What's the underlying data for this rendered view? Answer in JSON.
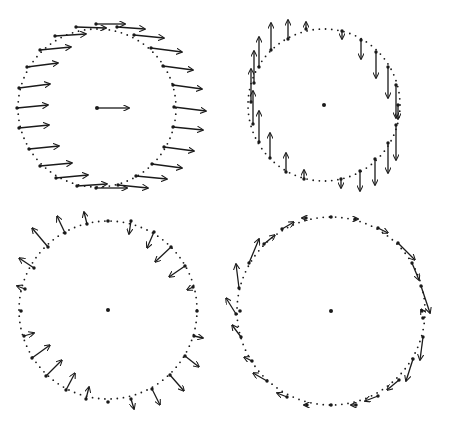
{
  "figure": {
    "width": 453,
    "height": 425,
    "ink_color": "#1a1a1a",
    "background": "#ffffff",
    "panels": [
      {
        "id": "top-left",
        "pattern": "uniform-translation-right",
        "cx": 97,
        "cy": 108,
        "r": 79,
        "center_arrow": {
          "dx": 32,
          "dy": 0
        },
        "arrows": [
          {
            "x": 96,
            "y": 24,
            "dx": 29,
            "dy": 0
          },
          {
            "x": 76,
            "y": 27,
            "dx": 30,
            "dy": 1
          },
          {
            "x": 117,
            "y": 27,
            "dx": 28,
            "dy": 2
          },
          {
            "x": 55,
            "y": 36,
            "dx": 31,
            "dy": -2
          },
          {
            "x": 134,
            "y": 35,
            "dx": 30,
            "dy": 3
          },
          {
            "x": 40,
            "y": 50,
            "dx": 31,
            "dy": -3
          },
          {
            "x": 151,
            "y": 48,
            "dx": 31,
            "dy": 4
          },
          {
            "x": 27,
            "y": 67,
            "dx": 31,
            "dy": -4
          },
          {
            "x": 163,
            "y": 66,
            "dx": 30,
            "dy": 4
          },
          {
            "x": 19,
            "y": 88,
            "dx": 31,
            "dy": -4
          },
          {
            "x": 173,
            "y": 85,
            "dx": 29,
            "dy": 4
          },
          {
            "x": 17,
            "y": 108,
            "dx": 31,
            "dy": -3
          },
          {
            "x": 174,
            "y": 107,
            "dx": 32,
            "dy": 4
          },
          {
            "x": 19,
            "y": 128,
            "dx": 30,
            "dy": -3
          },
          {
            "x": 173,
            "y": 127,
            "dx": 30,
            "dy": 3
          },
          {
            "x": 29,
            "y": 149,
            "dx": 30,
            "dy": -3
          },
          {
            "x": 164,
            "y": 147,
            "dx": 30,
            "dy": 4
          },
          {
            "x": 40,
            "y": 166,
            "dx": 32,
            "dy": -3
          },
          {
            "x": 152,
            "y": 164,
            "dx": 30,
            "dy": 4
          },
          {
            "x": 56,
            "y": 178,
            "dx": 32,
            "dy": -3
          },
          {
            "x": 136,
            "y": 176,
            "dx": 31,
            "dy": 3
          },
          {
            "x": 77,
            "y": 186,
            "dx": 30,
            "dy": -2
          },
          {
            "x": 118,
            "y": 185,
            "dx": 30,
            "dy": 3
          },
          {
            "x": 96,
            "y": 188,
            "dx": 31,
            "dy": 0
          }
        ]
      },
      {
        "id": "top-right",
        "pattern": "vertical-shear-rotation",
        "cx": 324,
        "cy": 105,
        "r": 76,
        "arrows": [
          {
            "x": 306,
            "y": 29,
            "dx": 0,
            "dy": -7
          },
          {
            "x": 288,
            "y": 39,
            "dx": 0,
            "dy": -19
          },
          {
            "x": 271,
            "y": 50,
            "dx": 0,
            "dy": -27
          },
          {
            "x": 259,
            "y": 67,
            "dx": 0,
            "dy": -30
          },
          {
            "x": 254,
            "y": 83,
            "dx": 0,
            "dy": -32
          },
          {
            "x": 251,
            "y": 102,
            "dx": 0,
            "dy": -33
          },
          {
            "x": 253,
            "y": 124,
            "dx": 0,
            "dy": -33
          },
          {
            "x": 259,
            "y": 142,
            "dx": 0,
            "dy": -31
          },
          {
            "x": 270,
            "y": 158,
            "dx": 0,
            "dy": -25
          },
          {
            "x": 286,
            "y": 172,
            "dx": 0,
            "dy": -19
          },
          {
            "x": 304,
            "y": 179,
            "dx": 0,
            "dy": -9
          },
          {
            "x": 342,
            "y": 31,
            "dx": 0,
            "dy": 8
          },
          {
            "x": 361,
            "y": 40,
            "dx": 0,
            "dy": 19
          },
          {
            "x": 376,
            "y": 52,
            "dx": 0,
            "dy": 26
          },
          {
            "x": 388,
            "y": 67,
            "dx": 0,
            "dy": 31
          },
          {
            "x": 396,
            "y": 85,
            "dx": 0,
            "dy": 33
          },
          {
            "x": 398,
            "y": 105,
            "dx": 0,
            "dy": 14
          },
          {
            "x": 396,
            "y": 125,
            "dx": 0,
            "dy": 35
          },
          {
            "x": 388,
            "y": 143,
            "dx": 0,
            "dy": 30
          },
          {
            "x": 375,
            "y": 159,
            "dx": 0,
            "dy": 26
          },
          {
            "x": 360,
            "y": 171,
            "dx": 0,
            "dy": 20
          },
          {
            "x": 341,
            "y": 179,
            "dx": 0,
            "dy": 9
          }
        ]
      },
      {
        "id": "bottom-left",
        "pattern": "pure-shear",
        "cx": 108,
        "cy": 310,
        "r": 89,
        "arrows": [
          {
            "x": 87,
            "y": 224,
            "dx": -3,
            "dy": -12
          },
          {
            "x": 65,
            "y": 233,
            "dx": -8,
            "dy": -17
          },
          {
            "x": 48,
            "y": 247,
            "dx": -16,
            "dy": -19
          },
          {
            "x": 34,
            "y": 268,
            "dx": -15,
            "dy": -10
          },
          {
            "x": 25,
            "y": 289,
            "dx": -8,
            "dy": -3
          },
          {
            "x": 24,
            "y": 336,
            "dx": 10,
            "dy": -3
          },
          {
            "x": 32,
            "y": 358,
            "dx": 18,
            "dy": -13
          },
          {
            "x": 46,
            "y": 376,
            "dx": 16,
            "dy": -16
          },
          {
            "x": 66,
            "y": 390,
            "dx": 9,
            "dy": -17
          },
          {
            "x": 86,
            "y": 399,
            "dx": 3,
            "dy": -12
          },
          {
            "x": 131,
            "y": 221,
            "dx": -2,
            "dy": 13
          },
          {
            "x": 154,
            "y": 232,
            "dx": -7,
            "dy": 16
          },
          {
            "x": 171,
            "y": 247,
            "dx": -16,
            "dy": 15
          },
          {
            "x": 185,
            "y": 266,
            "dx": -16,
            "dy": 11
          },
          {
            "x": 193,
            "y": 287,
            "dx": -6,
            "dy": 3
          },
          {
            "x": 194,
            "y": 336,
            "dx": 9,
            "dy": 2
          },
          {
            "x": 185,
            "y": 356,
            "dx": 14,
            "dy": 11
          },
          {
            "x": 170,
            "y": 375,
            "dx": 14,
            "dy": 16
          },
          {
            "x": 152,
            "y": 389,
            "dx": 8,
            "dy": 16
          },
          {
            "x": 131,
            "y": 399,
            "dx": 3,
            "dy": 10
          }
        ],
        "plain_points": [
          {
            "x": 108,
            "y": 221
          },
          {
            "x": 197,
            "y": 311
          },
          {
            "x": 108,
            "y": 402
          },
          {
            "x": 21,
            "y": 311
          }
        ]
      },
      {
        "id": "bottom-right",
        "pattern": "rotation-tangential",
        "cx": 331,
        "cy": 311,
        "r": 94,
        "arrows": [
          {
            "x": 306,
            "y": 218,
            "dx": -4,
            "dy": 0
          },
          {
            "x": 282,
            "y": 229,
            "dx": 12,
            "dy": -7
          },
          {
            "x": 264,
            "y": 244,
            "dx": 11,
            "dy": -9
          },
          {
            "x": 249,
            "y": 263,
            "dx": 10,
            "dy": -24
          },
          {
            "x": 239,
            "y": 288,
            "dx": -3,
            "dy": -24
          },
          {
            "x": 236,
            "y": 314,
            "dx": -10,
            "dy": -16
          },
          {
            "x": 241,
            "y": 337,
            "dx": -9,
            "dy": -12
          },
          {
            "x": 252,
            "y": 361,
            "dx": -8,
            "dy": -4
          },
          {
            "x": 267,
            "y": 381,
            "dx": -14,
            "dy": -8
          },
          {
            "x": 287,
            "y": 397,
            "dx": -10,
            "dy": -4
          },
          {
            "x": 307,
            "y": 405,
            "dx": -3,
            "dy": 0
          },
          {
            "x": 355,
            "y": 219,
            "dx": 3,
            "dy": 0
          },
          {
            "x": 378,
            "y": 228,
            "dx": 10,
            "dy": 5
          },
          {
            "x": 398,
            "y": 243,
            "dx": 17,
            "dy": 17
          },
          {
            "x": 412,
            "y": 263,
            "dx": 7,
            "dy": 17
          },
          {
            "x": 421,
            "y": 286,
            "dx": 9,
            "dy": 27
          },
          {
            "x": 422,
            "y": 311,
            "dx": -1,
            "dy": -2
          },
          {
            "x": 423,
            "y": 337,
            "dx": -3,
            "dy": 23
          },
          {
            "x": 413,
            "y": 359,
            "dx": -7,
            "dy": 22
          },
          {
            "x": 399,
            "y": 380,
            "dx": -12,
            "dy": 10
          },
          {
            "x": 378,
            "y": 396,
            "dx": -13,
            "dy": 5
          },
          {
            "x": 356,
            "y": 405,
            "dx": -5,
            "dy": 0
          }
        ],
        "plain_points": [
          {
            "x": 331,
            "y": 217
          },
          {
            "x": 331,
            "y": 405
          },
          {
            "x": 240,
            "y": 311
          },
          {
            "x": 423,
            "y": 318
          }
        ]
      }
    ]
  }
}
